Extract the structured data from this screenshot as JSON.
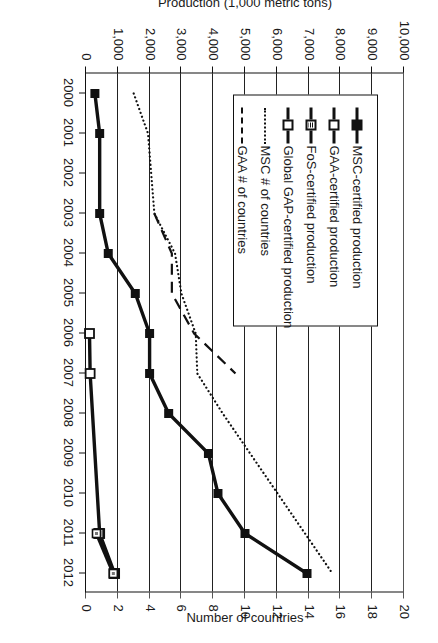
{
  "chart_data": {
    "type": "line",
    "title": "",
    "xlabel": "",
    "ylabel": "Production (1,000 metric tons)",
    "y2label": "Number of countries",
    "x": [
      2000,
      2001,
      2002,
      2003,
      2004,
      2005,
      2006,
      2007,
      2008,
      2009,
      2010,
      2011,
      2012
    ],
    "xlim": [
      1999.5,
      2012.5
    ],
    "ylim": [
      0,
      10000
    ],
    "y2lim": [
      0,
      20
    ],
    "yticks": [
      "0",
      "1,000",
      "2,000",
      "3,000",
      "4,000",
      "5,000",
      "6,000",
      "7,000",
      "8,000",
      "9,000",
      "10,000"
    ],
    "y2ticks": [
      "0",
      "2",
      "4",
      "6",
      "8",
      "10",
      "12",
      "14",
      "16",
      "18",
      "20"
    ],
    "xticks": [
      "2000",
      "2001",
      "2002",
      "2003",
      "2004",
      "2005",
      "2006",
      "2007",
      "2008",
      "2009",
      "2010",
      "2011",
      "2012"
    ],
    "grid": "horizontal",
    "legend_position": "lower-left-inside",
    "series": [
      {
        "name": "MSC-certified production",
        "key": "msc-prod",
        "axis": "left",
        "style": "solid-thick",
        "marker": "filled-square",
        "x": [
          2000,
          2001,
          2003,
          2004,
          2005,
          2006,
          2007,
          2008,
          2009,
          2010,
          2011,
          2012
        ],
        "values": [
          280,
          430,
          430,
          700,
          1550,
          2000,
          2000,
          2600,
          3850,
          4150,
          5000,
          6950
        ]
      },
      {
        "name": "GAA-certified production",
        "key": "gaa-prod",
        "axis": "left",
        "style": "solid-thick",
        "marker": "open-square",
        "x": [
          2006,
          2007,
          2011,
          2012
        ],
        "values": [
          110,
          130,
          430,
          900
        ]
      },
      {
        "name": "FoS-certified production",
        "key": "fos-prod",
        "axis": "left",
        "style": "solid-thick",
        "marker": "hatched-square",
        "x": [
          2011,
          2012
        ],
        "values": [
          400,
          880
        ]
      },
      {
        "name": "Global GAP-certified production",
        "key": "globalgap-prod",
        "axis": "left",
        "style": "solid-thick",
        "marker": "open-square-small",
        "x": [
          2011,
          2012
        ],
        "values": [
          330,
          860
        ]
      },
      {
        "name": "MSC # of countries",
        "key": "msc-countries",
        "axis": "right",
        "style": "dotted",
        "marker": "none",
        "x": [
          2000,
          2001,
          2003,
          2004,
          2005,
          2006,
          2007,
          2008,
          2012
        ],
        "values": [
          3.0,
          3.9,
          4.3,
          5.6,
          6.0,
          6.9,
          7.0,
          8.6,
          15.5
        ]
      },
      {
        "name": "GAA # of countries",
        "key": "gaa-countries",
        "axis": "right",
        "style": "dashed",
        "marker": "none",
        "x": [
          2003,
          2004,
          2005,
          2006,
          2007
        ],
        "values": [
          4.3,
          5.4,
          5.4,
          6.8,
          9.4
        ]
      }
    ]
  },
  "legend": {
    "items": [
      {
        "label": "MSC-certified production",
        "key": "msc-prod"
      },
      {
        "label": "GAA-certified production",
        "key": "gaa-prod"
      },
      {
        "label": "FoS-certified production",
        "key": "fos-prod"
      },
      {
        "label": "Global GAP-certified production",
        "key": "globalgap-prod"
      },
      {
        "label": "MSC # of countries",
        "key": "msc-countries"
      },
      {
        "label": "GAA # of countries",
        "key": "gaa-countries"
      }
    ]
  },
  "axes": {
    "left_title": "Production (1,000 metric tons)",
    "right_title": "Number of countries"
  }
}
